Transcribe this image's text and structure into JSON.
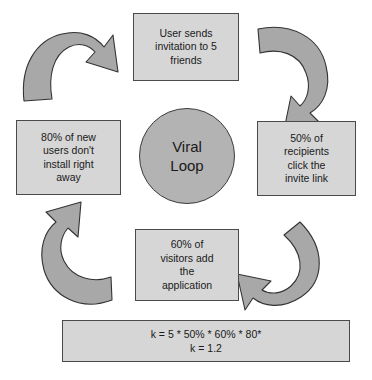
{
  "diagram": {
    "title": "Viral Loop",
    "center": {
      "line1": "Viral",
      "line2": "Loop",
      "fill": "#b3b3b3"
    },
    "box_fill": "#d6d6d6",
    "box_stroke": "#4a4a4a",
    "arrow_fill": "#a8a8a8",
    "arrow_stroke": "#333333",
    "nodes": {
      "top": "User sends\ninvitation to 5\nfriends",
      "right": "50% of\nrecipients\nclick the\ninvite link",
      "bottom": "60% of\nvisitors add\nthe\napplication",
      "left": "80% of new\nusers don't\ninstall right\naway"
    },
    "formula": "k = 5 * 50% * 60% * 80*\nk = 1.2",
    "arrows": {
      "top_left": "arrow-curved-up-right",
      "top_right": "arrow-curved-down-left",
      "bottom_right": "arrow-curved-left",
      "bottom_left": "arrow-curved-up-left"
    }
  }
}
